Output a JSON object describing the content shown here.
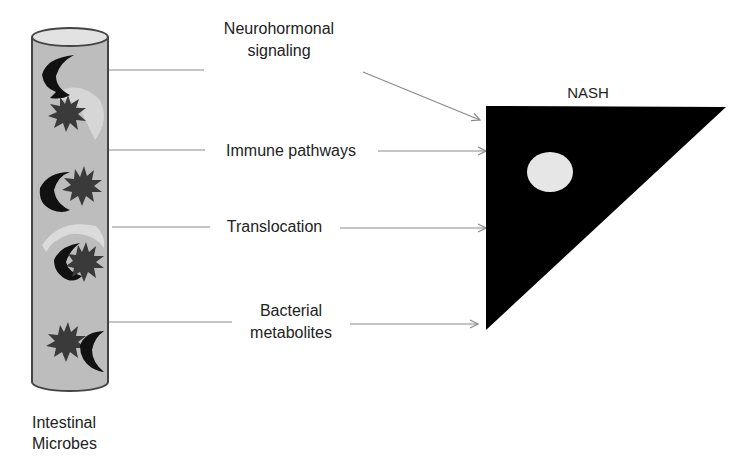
{
  "source": {
    "title_line1": "Intestinal",
    "title_line2": "Microbes",
    "fill_color": "#bdbdbd",
    "microbe_color": "#3a3a3a"
  },
  "target": {
    "title": "NASH",
    "fill_color": "#000000",
    "nucleus_color": "#e6e6e6"
  },
  "pathways": [
    {
      "line1": "Neurohormonal",
      "line2": "signaling"
    },
    {
      "line1": "Immune pathways",
      "line2": ""
    },
    {
      "line1": "Translocation",
      "line2": ""
    },
    {
      "line1": "Bacterial",
      "line2": "metabolites"
    }
  ],
  "colors": {
    "arrow": "#8a8a8a",
    "text": "#222222"
  }
}
